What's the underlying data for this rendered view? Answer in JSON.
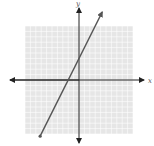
{
  "chart_data": {
    "type": "line",
    "title": "",
    "xlabel": "x",
    "ylabel": "y",
    "xlim": [
      -10,
      10
    ],
    "ylim": [
      -10,
      10
    ],
    "grid": true,
    "series": [
      {
        "name": "line",
        "equation": "y = 2x + 4",
        "slope": 2,
        "intercept": 4,
        "x": [
          -7.2,
          4.3
        ],
        "y": [
          -10.4,
          12.6
        ],
        "x_intercept": -2,
        "y_intercept": 4,
        "start_marker": "dot",
        "end_marker": "arrow"
      }
    ],
    "legend": null
  },
  "labels": {
    "x_axis": "x",
    "y_axis": "y"
  },
  "colors": {
    "grid_fill": "#e6e6e6",
    "grid_line": "#ffffff",
    "axis": "#222222",
    "line": "#555555"
  }
}
